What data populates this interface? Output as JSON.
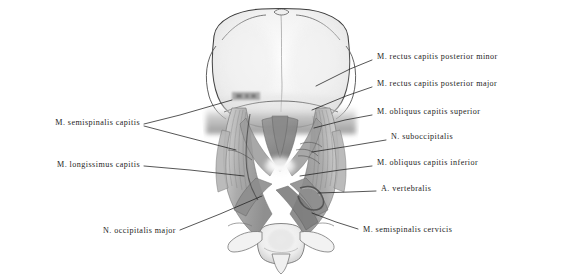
{
  "figure": {
    "kind": "anatomical-illustration",
    "view": "posterior view of suboccipital region",
    "medium": "graphite pencil drawing",
    "background_color": "#ffffff",
    "ink_color": "#1d1d1d"
  },
  "labels_right": [
    {
      "id": "rectus-capitis-posterior-minor",
      "text": "M. rectus capitis posterior minor",
      "x": 377,
      "y": 58,
      "leader": [
        [
          372,
          60
        ],
        [
          350,
          69
        ],
        [
          316,
          86
        ]
      ]
    },
    {
      "id": "rectus-capitis-posterior-major",
      "text": "M. rectus capitis posterior major",
      "x": 377,
      "y": 85,
      "leader": [
        [
          372,
          87
        ],
        [
          346,
          96
        ],
        [
          312,
          110
        ]
      ]
    },
    {
      "id": "obliquus-capitis-superior",
      "text": "M. obliquus capitis superior",
      "x": 377,
      "y": 113,
      "leader": [
        [
          372,
          115
        ],
        [
          345,
          120
        ],
        [
          314,
          128
        ]
      ]
    },
    {
      "id": "suboccipitalis",
      "text": "N. suboccipitalis",
      "x": 391,
      "y": 138,
      "leader": [
        [
          386,
          140
        ],
        [
          350,
          146
        ],
        [
          312,
          152
        ]
      ]
    },
    {
      "id": "obliquus-capitis-inferior",
      "text": "M. obliquus capitis inferior",
      "x": 377,
      "y": 164,
      "leader": [
        [
          372,
          166
        ],
        [
          340,
          170
        ],
        [
          300,
          176
        ]
      ]
    },
    {
      "id": "arteria-vertebralis",
      "text": "A. vertebralis",
      "x": 381,
      "y": 190,
      "leader": [
        [
          376,
          191
        ],
        [
          350,
          192
        ],
        [
          318,
          193
        ]
      ]
    },
    {
      "id": "semispinalis-cervicis",
      "text": "M. semispinalis cervicis",
      "x": 363,
      "y": 231,
      "leader": [
        [
          358,
          229
        ],
        [
          336,
          222
        ],
        [
          312,
          213
        ]
      ]
    }
  ],
  "labels_left": [
    {
      "id": "semispinalis-capitis",
      "text": "M. semispinalis capitis",
      "x": 140,
      "y": 124,
      "leaders": [
        [
          [
            144,
            124
          ],
          [
            180,
            115
          ],
          [
            232,
            100
          ]
        ],
        [
          [
            144,
            126
          ],
          [
            182,
            136
          ],
          [
            236,
            150
          ]
        ]
      ]
    },
    {
      "id": "longissimus-capitis",
      "text": "M. longissimus capitis",
      "x": 140,
      "y": 166,
      "leaders": [
        [
          [
            144,
            166
          ],
          [
            190,
            170
          ],
          [
            244,
            176
          ]
        ]
      ]
    },
    {
      "id": "occipitalis-major",
      "text": "N. occipitalis major",
      "x": 176,
      "y": 232,
      "leaders": [
        [
          [
            180,
            230
          ],
          [
            220,
            214
          ],
          [
            262,
            196
          ]
        ]
      ]
    }
  ]
}
